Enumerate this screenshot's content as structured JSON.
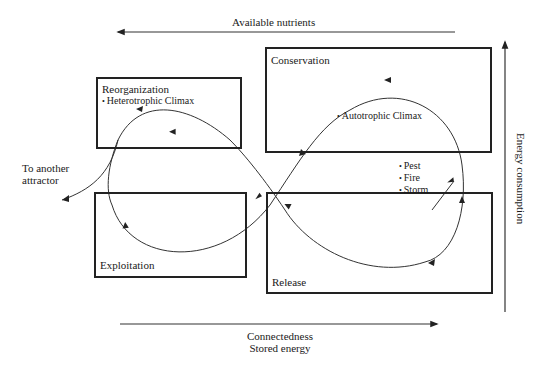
{
  "diagram": {
    "type": "adaptive-cycle",
    "axes": {
      "top": {
        "label": "Available nutrients",
        "direction": "left"
      },
      "bottom": {
        "label_line1": "Connectedness",
        "label_line2": "Stored energy",
        "direction": "right"
      },
      "right": {
        "label": "Energy consumption",
        "direction": "up"
      }
    },
    "phases": [
      {
        "id": "reorganization",
        "title": "Reorganization",
        "bullets": [
          "Heterotrophic Climax"
        ]
      },
      {
        "id": "conservation",
        "title": "Conservation",
        "bullets": []
      },
      {
        "id": "exploitation",
        "title": "Exploitation",
        "bullets": []
      },
      {
        "id": "release",
        "title": "Release",
        "bullets": []
      }
    ],
    "annotations": {
      "autotrophic": "Autotrophic Climax",
      "disturbances": [
        "Pest",
        "Fire",
        "Storm"
      ],
      "exit_line1": "To another",
      "exit_line2": "attractor"
    },
    "colors": {
      "ink": "#222222",
      "background": "#ffffff"
    }
  }
}
